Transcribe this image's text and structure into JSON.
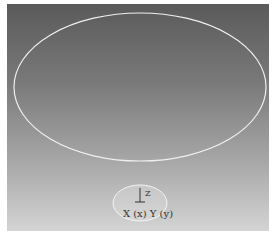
{
  "viewport": {
    "background": {
      "top": "#5a5a5a",
      "bottom": "#d4d4d4"
    },
    "ellipse_color": "#f0f0f0"
  },
  "gizmo": {
    "z_label": "Z",
    "xy_label": "X (x) Y (y)",
    "ellipse_color": "#f4f4f4"
  }
}
